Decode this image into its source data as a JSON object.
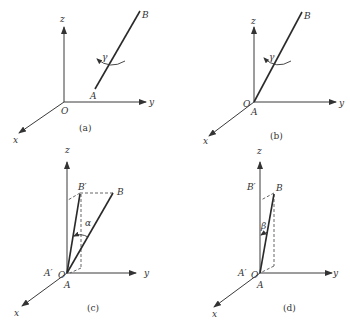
{
  "figure": {
    "panels": [
      {
        "id": "a",
        "caption": "(a)",
        "axes": {
          "x": "x",
          "y": "y",
          "z": "z"
        },
        "origin_label": "O",
        "points": {
          "A": "A",
          "B": "B"
        },
        "angle": "γ",
        "stray_label": "z"
      },
      {
        "id": "b",
        "caption": "(b)",
        "axes": {
          "x": "x",
          "y": "y",
          "z": "z"
        },
        "origin_label": "O",
        "points": {
          "A": "A",
          "B": "B"
        },
        "angle": "γ",
        "stray_label": "z"
      },
      {
        "id": "c",
        "caption": "(c)",
        "axes": {
          "x": "x",
          "y": "y"
        },
        "origin_label": "O",
        "points": {
          "A": "A",
          "B": "B",
          "A_prime": "A′",
          "B_prime": "B′"
        },
        "angle": "α"
      },
      {
        "id": "d",
        "caption": "(d)",
        "axes": {
          "x": "x",
          "y": "y"
        },
        "origin_label": "O",
        "points": {
          "A": "A",
          "B": "B",
          "A_prime": "A′",
          "B_prime": "B′"
        },
        "angle": "β"
      }
    ]
  },
  "colors": {
    "line": "#2a2a2a",
    "axis": "#3a3a3a",
    "text": "#333333"
  }
}
